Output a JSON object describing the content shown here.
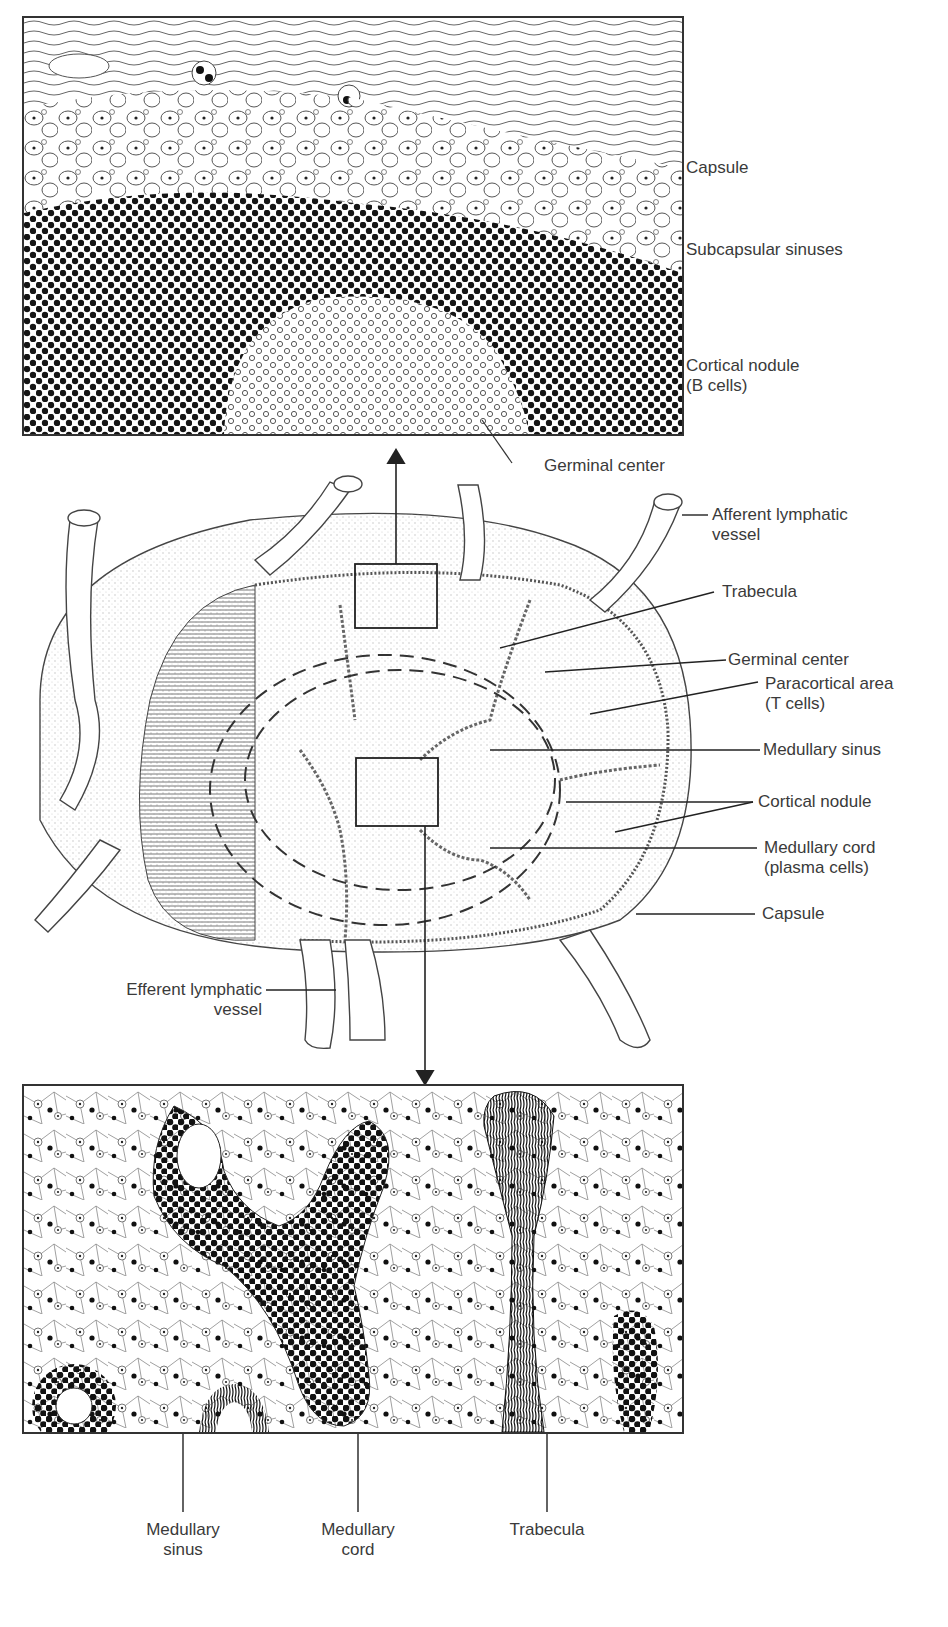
{
  "figure": {
    "panels": {
      "top_inset": {
        "region": "cortex"
      },
      "middle": {
        "region": "whole lymph node"
      },
      "bottom_inset": {
        "region": "medulla"
      }
    },
    "colors": {
      "ink": "#222222",
      "background": "#ffffff",
      "label_text": "#3a3a3a"
    }
  },
  "labels": {
    "top": {
      "capsule": "Capsule",
      "subcapsular_sinuses": "Subcapsular sinuses",
      "cortical_nodule_line1": "Cortical nodule",
      "cortical_nodule_line2": "(B cells)",
      "germinal_center": "Germinal center"
    },
    "middle": {
      "afferent_line1": "Afferent lymphatic",
      "afferent_line2": "vessel",
      "trabecula": "Trabecula",
      "germinal_center": "Germinal center",
      "paracortical_line1": "Paracortical area",
      "paracortical_line2": "(T cells)",
      "medullary_sinus": "Medullary sinus",
      "cortical_nodule": "Cortical nodule",
      "medullary_cord_line1": "Medullary cord",
      "medullary_cord_line2": "(plasma cells)",
      "capsule": "Capsule",
      "efferent_line1": "Efferent lymphatic",
      "efferent_line2": "vessel"
    },
    "bottom": {
      "medullary_sinus_line1": "Medullary",
      "medullary_sinus_line2": "sinus",
      "medullary_cord_line1": "Medullary",
      "medullary_cord_line2": "cord",
      "trabecula": "Trabecula"
    }
  }
}
